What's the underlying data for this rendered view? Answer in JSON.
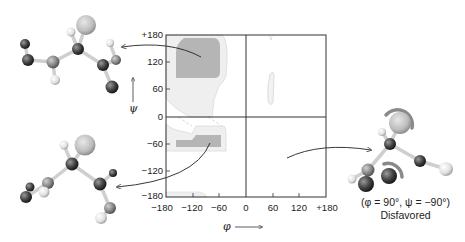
{
  "diagram": {
    "type": "Ramachandran plot",
    "x_axis": {
      "symbol": "φ",
      "ticks": [
        "−180",
        "−120",
        "−60",
        "0",
        "60",
        "120",
        "+180"
      ]
    },
    "y_axis": {
      "symbol": "ψ",
      "ticks": [
        "+180",
        "120",
        "60",
        "0",
        "−60",
        "−120",
        "−180"
      ]
    },
    "regions": [
      {
        "name": "beta-sheet-core",
        "shade": "dark",
        "phi": [
          -155,
          -60
        ],
        "psi": [
          95,
          175
        ]
      },
      {
        "name": "beta-allowed",
        "shade": "light",
        "phi": [
          -180,
          -45
        ]
      },
      {
        "name": "alpha-helix-core",
        "shade": "dark",
        "phi": [
          -150,
          -55
        ],
        "psi": [
          -70,
          -45
        ]
      },
      {
        "name": "alpha-allowed",
        "shade": "light"
      },
      {
        "name": "left-handed-helix-allowed",
        "shade": "light",
        "phi": [
          50,
          70
        ],
        "psi": [
          10,
          70
        ]
      }
    ],
    "molecules": [
      {
        "name": "top-left-conformation",
        "points_to": "beta region"
      },
      {
        "name": "bottom-left-conformation",
        "points_to": "alpha region"
      },
      {
        "name": "right-conformation",
        "points_to": "disfavored region"
      }
    ],
    "caption": {
      "line1": "(φ = 90°, ψ = −90°)",
      "line2": "Disfavored"
    },
    "colors": {
      "dark_region": "#b4b4b4",
      "light_region": "#eeeeee",
      "light_outline": "#d8d8d8",
      "frame": "#333333"
    }
  }
}
